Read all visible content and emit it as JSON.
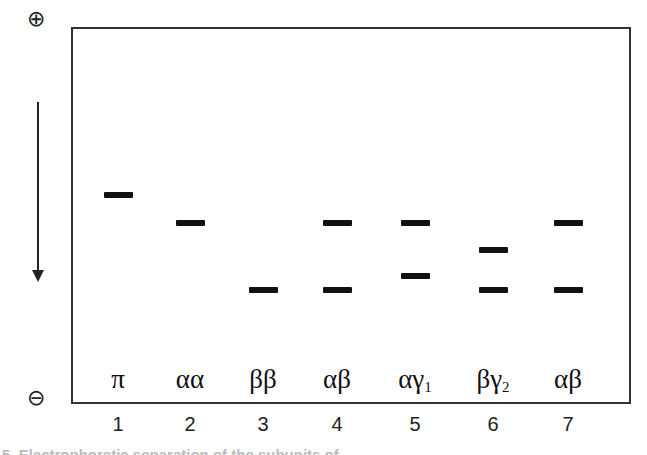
{
  "figure": {
    "poles": {
      "anode_symbol": "⊕",
      "cathode_symbol": "⊖"
    },
    "migration_arrow": "downward",
    "lanes": [
      {
        "number": "1",
        "label": "π",
        "sub": "",
        "bands_y": [
          195
        ],
        "x": 118
      },
      {
        "number": "2",
        "label": "αα",
        "sub": "",
        "bands_y": [
          223
        ],
        "x": 190
      },
      {
        "number": "3",
        "label": "ββ",
        "sub": "",
        "bands_y": [
          290
        ],
        "x": 263
      },
      {
        "number": "4",
        "label": "αβ",
        "sub": "",
        "bands_y": [
          223,
          290
        ],
        "x": 337
      },
      {
        "number": "5",
        "label": "αγ",
        "sub": "1",
        "bands_y": [
          223,
          276
        ],
        "x": 415
      },
      {
        "number": "6",
        "label": "βγ",
        "sub": "2",
        "bands_y": [
          250,
          290
        ],
        "x": 493
      },
      {
        "number": "7",
        "label": "αβ",
        "sub": "",
        "bands_y": [
          223,
          290
        ],
        "x": 568
      }
    ],
    "caption_partial": "5. Electrophoretic separation of the subunits of ... "
  }
}
